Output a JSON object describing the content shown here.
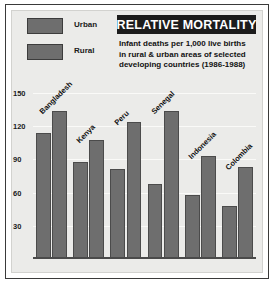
{
  "title": "RELATIVE MORTALITY",
  "subtitle_lines": [
    "Infant deaths per 1,000 live births",
    "in rural &amp; urban areas of selected",
    "developing countries (1986-1988)"
  ],
  "legend": [
    {
      "label": "Urban",
      "color": "#6e6e6e"
    },
    {
      "label": "Rural",
      "color": "#6e6e6e"
    }
  ],
  "axis": {
    "ticks": [
      "150",
      "120",
      "90",
      "60",
      "30"
    ]
  },
  "colors": {
    "bar": "#6e6e6e",
    "bar_edge": "#4b4b4b",
    "plot_background": "#ebebe9",
    "gridline": "#fafaf8",
    "title_background": "#1c1c1c",
    "title_text": "#ffffff",
    "frame": "#3a3a3a"
  },
  "chart_data": {
    "type": "bar",
    "title": "RELATIVE MORTALITY",
    "subtitle": "Infant deaths per 1,000 live births in rural & urban areas of selected developing countries (1986-1988)",
    "xlabel": "",
    "ylabel": "",
    "ylim": [
      0,
      160
    ],
    "yticks": [
      30,
      60,
      90,
      120,
      150
    ],
    "grid": true,
    "legend_position": "top-left",
    "categories": [
      "Bangladesh",
      "Kenya",
      "Peru",
      "Senegal",
      "Indonesia",
      "Colombia"
    ],
    "series": [
      {
        "name": "Urban",
        "values": [
          114,
          88,
          81,
          68,
          58,
          48
        ]
      },
      {
        "name": "Rural",
        "values": [
          134,
          108,
          124,
          134,
          93,
          83
        ]
      }
    ]
  }
}
